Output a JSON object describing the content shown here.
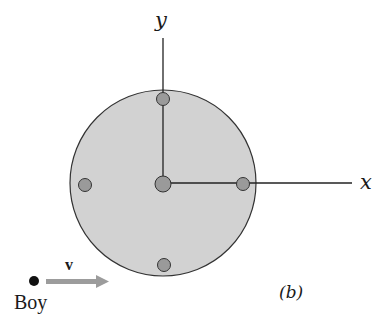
{
  "diagram": {
    "axes": {
      "x_label": "x",
      "y_label": "y"
    },
    "boy": {
      "label": "Boy",
      "velocity_label": "v"
    },
    "panel_label": "(b)",
    "colors": {
      "disk_fill": "#cfcfcf",
      "disk_stroke": "#333333",
      "mass_fill": "#9a9a9a",
      "arrow": "#9c9c9c",
      "line": "#222222"
    },
    "masses": [
      {
        "position": "top"
      },
      {
        "position": "left"
      },
      {
        "position": "center"
      },
      {
        "position": "right"
      },
      {
        "position": "bottom"
      }
    ]
  }
}
